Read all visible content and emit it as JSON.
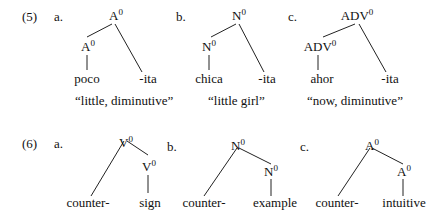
{
  "examples": [
    {
      "number": "(5)",
      "items": [
        {
          "letter": "a.",
          "root": {
            "cat": "A",
            "sup": "0"
          },
          "left": {
            "cat": "A",
            "sup": "0"
          },
          "left_leaf": "poco",
          "right_leaf": "-ita",
          "gloss": "“little, diminutive”"
        },
        {
          "letter": "b.",
          "root": {
            "cat": "N",
            "sup": "0"
          },
          "left": {
            "cat": "N",
            "sup": "0"
          },
          "left_leaf": "chica",
          "right_leaf": "-ita",
          "gloss": "“little girl”"
        },
        {
          "letter": "c.",
          "root": {
            "cat": "ADV",
            "sup": "0"
          },
          "left": {
            "cat": "ADV",
            "sup": "0"
          },
          "left_leaf": "ahor",
          "right_leaf": "-ita",
          "gloss": "“now, diminutive”"
        }
      ]
    },
    {
      "number": "(6)",
      "items": [
        {
          "letter": "a.",
          "root": {
            "cat": "V",
            "sup": "0"
          },
          "right": {
            "cat": "V",
            "sup": "0"
          },
          "left_leaf": "counter-",
          "right_leaf": "sign"
        },
        {
          "letter": "b.",
          "root": {
            "cat": "N",
            "sup": "0"
          },
          "right": {
            "cat": "N",
            "sup": "0"
          },
          "left_leaf": "counter-",
          "right_leaf": "example"
        },
        {
          "letter": "c.",
          "root": {
            "cat": "A",
            "sup": "0"
          },
          "right": {
            "cat": "A",
            "sup": "0"
          },
          "left_leaf": "counter-",
          "right_leaf": "intuitive"
        }
      ]
    }
  ]
}
